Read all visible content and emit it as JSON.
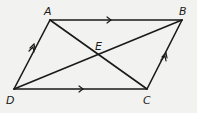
{
  "diagram": {
    "type": "parallelogram",
    "stroke_color": "#1a1a1a",
    "background": "#f2f2f0",
    "points": {
      "A": {
        "label": "A",
        "x": 50,
        "y": 20
      },
      "B": {
        "label": "B",
        "x": 182,
        "y": 20
      },
      "C": {
        "label": "C",
        "x": 147,
        "y": 89
      },
      "D": {
        "label": "D",
        "x": 14,
        "y": 89
      },
      "E": {
        "label": "E",
        "x": 99,
        "y": 55
      }
    },
    "sides": [
      {
        "from": "A",
        "to": "B",
        "marks": "single-arrow"
      },
      {
        "from": "D",
        "to": "C",
        "marks": "single-arrow"
      },
      {
        "from": "D",
        "to": "A",
        "marks": "double-arrow"
      },
      {
        "from": "C",
        "to": "B",
        "marks": "double-arrow"
      }
    ],
    "diagonals": [
      {
        "from": "A",
        "to": "C"
      },
      {
        "from": "D",
        "to": "B"
      }
    ]
  }
}
